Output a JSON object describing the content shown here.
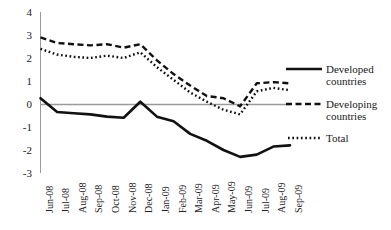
{
  "chart_data": {
    "type": "line",
    "title": "",
    "subtitle": "",
    "xlabel": "",
    "ylabel": "",
    "ylim": [
      -3,
      4
    ],
    "yticks": [
      4,
      3,
      2,
      1,
      0,
      -1,
      -2,
      -3
    ],
    "grid": false,
    "zero_line": true,
    "legend_position": "right",
    "categories": [
      "Jun-08",
      "Jul-08",
      "Aug-08",
      "Sep-08",
      "Oct-08",
      "Nov-08",
      "Dec-08",
      "Jan-09",
      "Feb-09",
      "Mar-09",
      "Apr-09",
      "May-09",
      "Jun-09",
      "Jul-09",
      "Aug-09",
      "Sep-09"
    ],
    "series": [
      {
        "name": "Developed countries",
        "style": "solid",
        "color": "#111111",
        "values": [
          0.25,
          -0.35,
          -0.4,
          -0.45,
          -0.55,
          -0.6,
          0.1,
          -0.55,
          -0.75,
          -1.3,
          -1.6,
          -2.0,
          -2.3,
          -2.2,
          -1.85,
          -1.8
        ]
      },
      {
        "name": "Developing countries",
        "style": "dashed",
        "color": "#111111",
        "values": [
          2.9,
          2.65,
          2.6,
          2.55,
          2.6,
          2.45,
          2.6,
          1.9,
          1.3,
          0.8,
          0.35,
          0.25,
          -0.1,
          0.9,
          0.95,
          0.9
        ]
      },
      {
        "name": "Total",
        "style": "dotted",
        "color": "#111111",
        "values": [
          2.4,
          2.15,
          2.05,
          2.0,
          2.1,
          2.0,
          2.25,
          1.6,
          1.05,
          0.5,
          0.1,
          -0.25,
          -0.45,
          0.55,
          0.7,
          0.6
        ]
      }
    ]
  },
  "legend": {
    "items": [
      {
        "label_line1": "Developed",
        "label_line2": "countries",
        "style": "solid"
      },
      {
        "label_line1": "Developing",
        "label_line2": "countries",
        "style": "dashed"
      },
      {
        "label_line1": "Total",
        "label_line2": "",
        "style": "dotted"
      }
    ]
  }
}
